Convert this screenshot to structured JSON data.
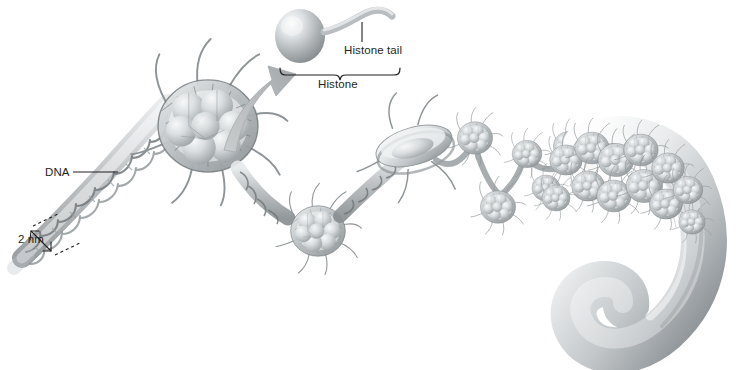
{
  "figure": {
    "background_color": "#ffffff",
    "width": 737,
    "height": 370
  },
  "annotations": {
    "dna_label": "DNA",
    "scale_label": "2 nm",
    "histone_tail_label": "Histone tail",
    "histone_label": "Histone",
    "text_color": "#231f20",
    "leader_color": "#231f20"
  },
  "structures": {
    "dna_double_helix": {
      "name": "DNA double helix",
      "diameter_label": "2 nm"
    },
    "free_histone": {
      "name": "Histone",
      "parts": [
        "histone core sphere",
        "histone tail"
      ]
    },
    "nucleosomes": [
      {
        "id": "nucleosome-large-face",
        "view": "face-on",
        "core_spheres": 8
      },
      {
        "id": "nucleosome-second",
        "view": "face-on",
        "core_spheres": 8
      },
      {
        "id": "nucleosome-edge-on",
        "view": "edge-on",
        "core_spheres": 8
      },
      {
        "id": "nucleosome-small-1",
        "view": "face-on",
        "core_spheres": 8
      },
      {
        "id": "nucleosome-small-2",
        "view": "face-on",
        "core_spheres": 8
      },
      {
        "id": "nucleosome-small-3",
        "view": "face-on",
        "core_spheres": 8
      },
      {
        "id": "nucleosome-small-4",
        "view": "face-on",
        "core_spheres": 8
      },
      {
        "id": "nucleosome-small-5",
        "view": "face-on",
        "core_spheres": 8
      }
    ],
    "chromatin_fiber": {
      "name": "Condensed chromatin fiber",
      "shape": "hooked spiral"
    },
    "callout_arrow": {
      "name": "magnification arrow",
      "direction": "up-right",
      "color": "#b9bcbe"
    }
  },
  "palette": {
    "ink_dark": "#231f20",
    "gray_line": "#7d8285",
    "gray_mid": "#a8acaf",
    "gray_light": "#d5d8da",
    "gray_pale": "#eceeef",
    "shadow": "#6e7477"
  }
}
